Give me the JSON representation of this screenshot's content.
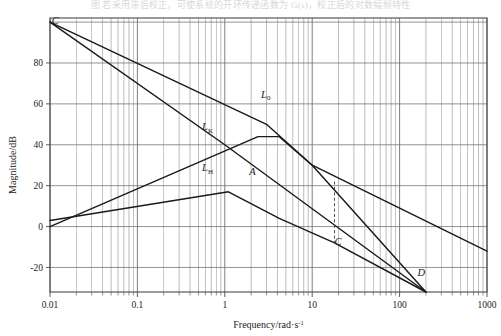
{
  "page": {
    "caption_top": "图 若采用滞后校正，可使系统的开环传递函数为 G(s)，校正后的对数幅频特性"
  },
  "axes": {
    "x_title_main": "Frequency/rad",
    "x_title_unit_sep": "·s",
    "x_title_exp": "-1",
    "y_title": "Magnitude/dB",
    "x_ticks": [
      "0.01",
      "0.1",
      "1",
      "10",
      "100",
      "1000"
    ],
    "y_ticks": [
      "-20",
      "0",
      "20",
      "40",
      "60",
      "80"
    ],
    "x_min": 0.01,
    "x_max": 1000,
    "y_min": -32,
    "y_max": 102,
    "grid": "log-x linear-y",
    "frame_color": "#4a4a4a",
    "grid_color": "#6f6f6f",
    "curve_color": "#1a1a1a"
  },
  "labels": {
    "C_top": "C",
    "L0": "L",
    "L0_sub": "0",
    "LK": "L",
    "LK_sub": "K",
    "LH": "L",
    "LH_sub": "H",
    "A": "A",
    "C_mid": "C",
    "D": "D"
  },
  "chart_data": {
    "type": "line",
    "title": "",
    "xlabel": "Frequency/rad·s^-1",
    "ylabel": "Magnitude/dB",
    "xscale": "log",
    "xlim": [
      0.01,
      1000
    ],
    "ylim": [
      -32,
      102
    ],
    "grid": true,
    "legend": "inline-curve-labels",
    "annotations": [
      {
        "name": "C",
        "x": 0.0105,
        "y": 99,
        "text": "C",
        "desc": "common origin of L0 and LK at top-left"
      },
      {
        "name": "L0",
        "x": 2.6,
        "y": 63,
        "text": "L0",
        "desc": "uncompensated open-loop magnitude"
      },
      {
        "name": "LK",
        "x": 0.55,
        "y": 47,
        "text": "LK",
        "desc": "compensator/gain asymptote"
      },
      {
        "name": "LH",
        "x": 0.55,
        "y": 27,
        "text": "LH",
        "desc": "lag network magnitude, rising branch"
      },
      {
        "name": "A",
        "x": 1.9,
        "y": 25,
        "text": "A",
        "desc": "corner point of compensated curve"
      },
      {
        "name": "C",
        "x": 18,
        "y": -9,
        "text": "C",
        "desc": "gain crossover marker at base of dashed line"
      },
      {
        "name": "D",
        "x": 160,
        "y": -24,
        "text": "D",
        "desc": "intersection of L0 and LK at bottom right"
      }
    ],
    "dashed_marker": {
      "x": 18,
      "y_from": 22,
      "y_to": -8
    },
    "series": [
      {
        "name": "L0",
        "style": "solid",
        "points": [
          {
            "x": 0.01,
            "y": 100
          },
          {
            "x": 3.0,
            "y": 50
          },
          {
            "x": 10.0,
            "y": 30
          },
          {
            "x": 200.0,
            "y": -32
          }
        ]
      },
      {
        "name": "LK",
        "style": "solid",
        "points": [
          {
            "x": 0.01,
            "y": 100
          },
          {
            "x": 1.0,
            "y": 40
          },
          {
            "x": 200.0,
            "y": -32
          }
        ]
      },
      {
        "name": "LH",
        "style": "solid",
        "points": [
          {
            "x": 0.01,
            "y": 0
          },
          {
            "x": 2.4,
            "y": 44
          },
          {
            "x": 4.2,
            "y": 44
          },
          {
            "x": 10.0,
            "y": 30
          },
          {
            "x": 1000.0,
            "y": -12
          }
        ]
      },
      {
        "name": "A",
        "style": "solid",
        "points": [
          {
            "x": 0.01,
            "y": 3
          },
          {
            "x": 1.1,
            "y": 17
          },
          {
            "x": 4.2,
            "y": 4
          },
          {
            "x": 18.0,
            "y": -8
          },
          {
            "x": 200.0,
            "y": -32
          }
        ]
      }
    ]
  }
}
